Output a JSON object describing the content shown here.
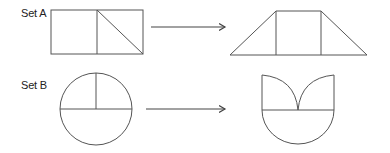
{
  "sets": [
    {
      "label": "Set A",
      "source_shape": "rectangle-split-with-diagonal",
      "target_shape": "trapezoid-with-two-verticals"
    },
    {
      "label": "Set B",
      "source_shape": "circle-with-diameter-and-radius",
      "target_shape": "semicircle-with-two-quarter-arcs"
    }
  ],
  "colors": {
    "stroke": "#555555",
    "text": "#222222",
    "background": "#ffffff"
  }
}
